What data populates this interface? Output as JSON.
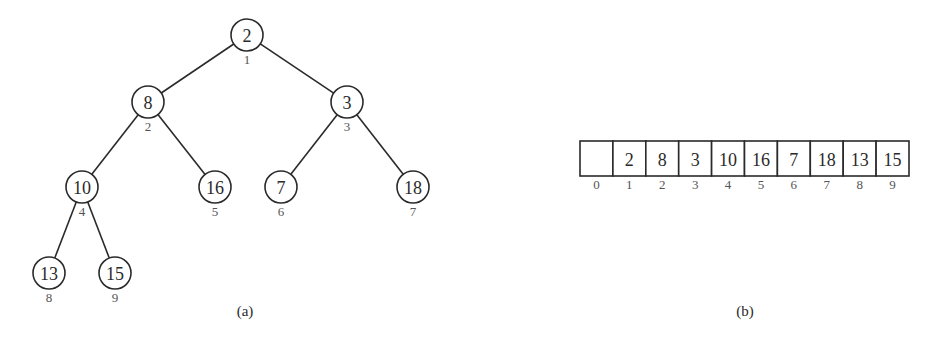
{
  "tree": {
    "caption": "(a)",
    "nodes": [
      {
        "index": "1",
        "value": "2",
        "x": 247,
        "y": 35
      },
      {
        "index": "2",
        "value": "8",
        "x": 148,
        "y": 102
      },
      {
        "index": "3",
        "value": "3",
        "x": 347,
        "y": 102
      },
      {
        "index": "4",
        "value": "10",
        "x": 82,
        "y": 187
      },
      {
        "index": "5",
        "value": "16",
        "x": 215,
        "y": 187
      },
      {
        "index": "6",
        "value": "7",
        "x": 281,
        "y": 187
      },
      {
        "index": "7",
        "value": "18",
        "x": 413,
        "y": 187
      },
      {
        "index": "8",
        "value": "13",
        "x": 49,
        "y": 273
      },
      {
        "index": "9",
        "value": "15",
        "x": 115,
        "y": 273
      }
    ],
    "edges": [
      [
        0,
        1
      ],
      [
        0,
        2
      ],
      [
        1,
        3
      ],
      [
        1,
        4
      ],
      [
        2,
        5
      ],
      [
        2,
        6
      ],
      [
        3,
        7
      ],
      [
        3,
        8
      ]
    ]
  },
  "array": {
    "caption": "(b)",
    "cells": [
      {
        "index": "0",
        "value": ""
      },
      {
        "index": "1",
        "value": "2"
      },
      {
        "index": "2",
        "value": "8"
      },
      {
        "index": "3",
        "value": "3"
      },
      {
        "index": "4",
        "value": "10"
      },
      {
        "index": "5",
        "value": "16"
      },
      {
        "index": "6",
        "value": "7"
      },
      {
        "index": "7",
        "value": "18"
      },
      {
        "index": "8",
        "value": "13"
      },
      {
        "index": "9",
        "value": "15"
      }
    ]
  }
}
